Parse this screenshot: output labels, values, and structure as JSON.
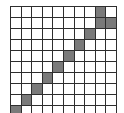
{
  "grid": {
    "rows": 10,
    "cols": 10,
    "colors": {
      "filled": "#7a7a7a",
      "empty": "#ffffff",
      "line": "#2e2e2e"
    },
    "filled_cells": [
      [
        0,
        8
      ],
      [
        1,
        8
      ],
      [
        1,
        9
      ],
      [
        2,
        7
      ],
      [
        3,
        6
      ],
      [
        4,
        5
      ],
      [
        5,
        4
      ],
      [
        6,
        3
      ],
      [
        7,
        2
      ],
      [
        8,
        1
      ],
      [
        9,
        0
      ]
    ]
  }
}
